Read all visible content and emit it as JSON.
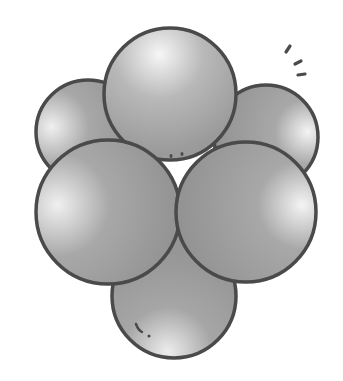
{
  "illustration": {
    "subject": "cluster of six spheres",
    "colors": {
      "background": "#ffffff",
      "outline": "#4a4a4a",
      "fill_light": "#f4f4f4",
      "fill_mid": "#a9a9a9",
      "fill_dark": "#8e8e8e"
    },
    "spheres": [
      {
        "name": "back-left",
        "cx": 88,
        "cy": 132,
        "r": 52
      },
      {
        "name": "back-right",
        "cx": 266,
        "cy": 137,
        "r": 52
      },
      {
        "name": "bottom",
        "cx": 174,
        "cy": 296,
        "r": 62
      },
      {
        "name": "top",
        "cx": 170,
        "cy": 94,
        "r": 66
      },
      {
        "name": "front-left",
        "cx": 108,
        "cy": 212,
        "r": 72
      },
      {
        "name": "front-right",
        "cx": 246,
        "cy": 212,
        "r": 70
      }
    ]
  }
}
